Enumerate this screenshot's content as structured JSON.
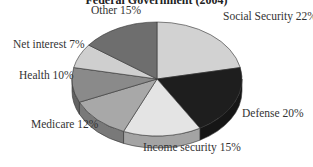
{
  "chart_data": {
    "type": "pie",
    "title": "Federal Government (2004)",
    "style": "3d",
    "categories": [
      "Social Security",
      "Defense",
      "Income security",
      "Medicare",
      "Health",
      "Net interest",
      "Other"
    ],
    "values": [
      22,
      20,
      15,
      12,
      10,
      7,
      15
    ],
    "unit": "%",
    "colors": [
      "#d2d2d2",
      "#1e1e1e",
      "#e4e4e4",
      "#a8a8a8",
      "#8a8a8a",
      "#cfcfcf",
      "#6e6e6e"
    ],
    "labels": [
      {
        "text": "Social Security 22%",
        "x": 223,
        "y": 18
      },
      {
        "text": "Defense 20%",
        "x": 242,
        "y": 115
      },
      {
        "text": "Income security 15%",
        "x": 143,
        "y": 149
      },
      {
        "text": "Medicare 12%",
        "x": 31,
        "y": 126
      },
      {
        "text": "Health 10%",
        "x": 19,
        "y": 77
      },
      {
        "text": "Net interest 7%",
        "x": 13,
        "y": 46
      },
      {
        "text": "Other 15%",
        "x": 91,
        "y": 12
      }
    ]
  }
}
